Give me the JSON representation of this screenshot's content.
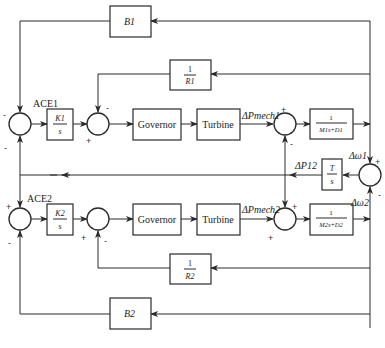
{
  "diagram": {
    "type": "two-area load frequency control block diagram",
    "area1": {
      "bias_block": "B1",
      "droop_block": {
        "num": "1",
        "den": "R1"
      },
      "integrator_block": {
        "num": "K1",
        "den": "s"
      },
      "governor": "Governor",
      "turbine": "Turbine",
      "mech_power_label": "ΔPmech1",
      "plant_block": {
        "num": "1",
        "den": "M1s+D1"
      },
      "ace_label": "ACE1",
      "freq_label": "Δω1"
    },
    "area2": {
      "bias_block": "B2",
      "droop_block": {
        "num": "1",
        "den": "R2"
      },
      "integrator_block": {
        "num": "K2",
        "den": "s"
      },
      "governor": "Governor",
      "turbine": "Turbine",
      "mech_power_label": "ΔPmech2",
      "plant_block": {
        "num": "1",
        "den": "M2s+D2"
      },
      "ace_label": "ACE2",
      "freq_label": "Δω2"
    },
    "tie_line": {
      "block": {
        "num": "T",
        "den": "s"
      },
      "power_label": "ΔP12"
    },
    "signs": {
      "sum1_top": "-",
      "sum1_bottom": "-",
      "sum2_top": "-",
      "sum2_left": "+",
      "sum3_top": "+",
      "sum3_bottom": "-",
      "sum4_top": "+",
      "sum4_bottom": "-",
      "sum5_top": "+",
      "sum5_bottom": "-",
      "sum6_left": "+",
      "sum6_bottom": "-",
      "sum7_top": "+",
      "sum7_bottom": "+"
    }
  }
}
